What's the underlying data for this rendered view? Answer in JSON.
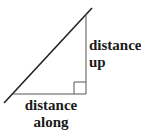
{
  "diagram": {
    "type": "right-triangle-slope",
    "labels": {
      "vertical_leg_line1": "distance",
      "vertical_leg_line2": "up",
      "horizontal_leg_line1": "distance",
      "horizontal_leg_line2": "along"
    },
    "colors": {
      "hypotenuse": "#222222",
      "legs": "#555555",
      "text": "#1a1a1a"
    }
  }
}
